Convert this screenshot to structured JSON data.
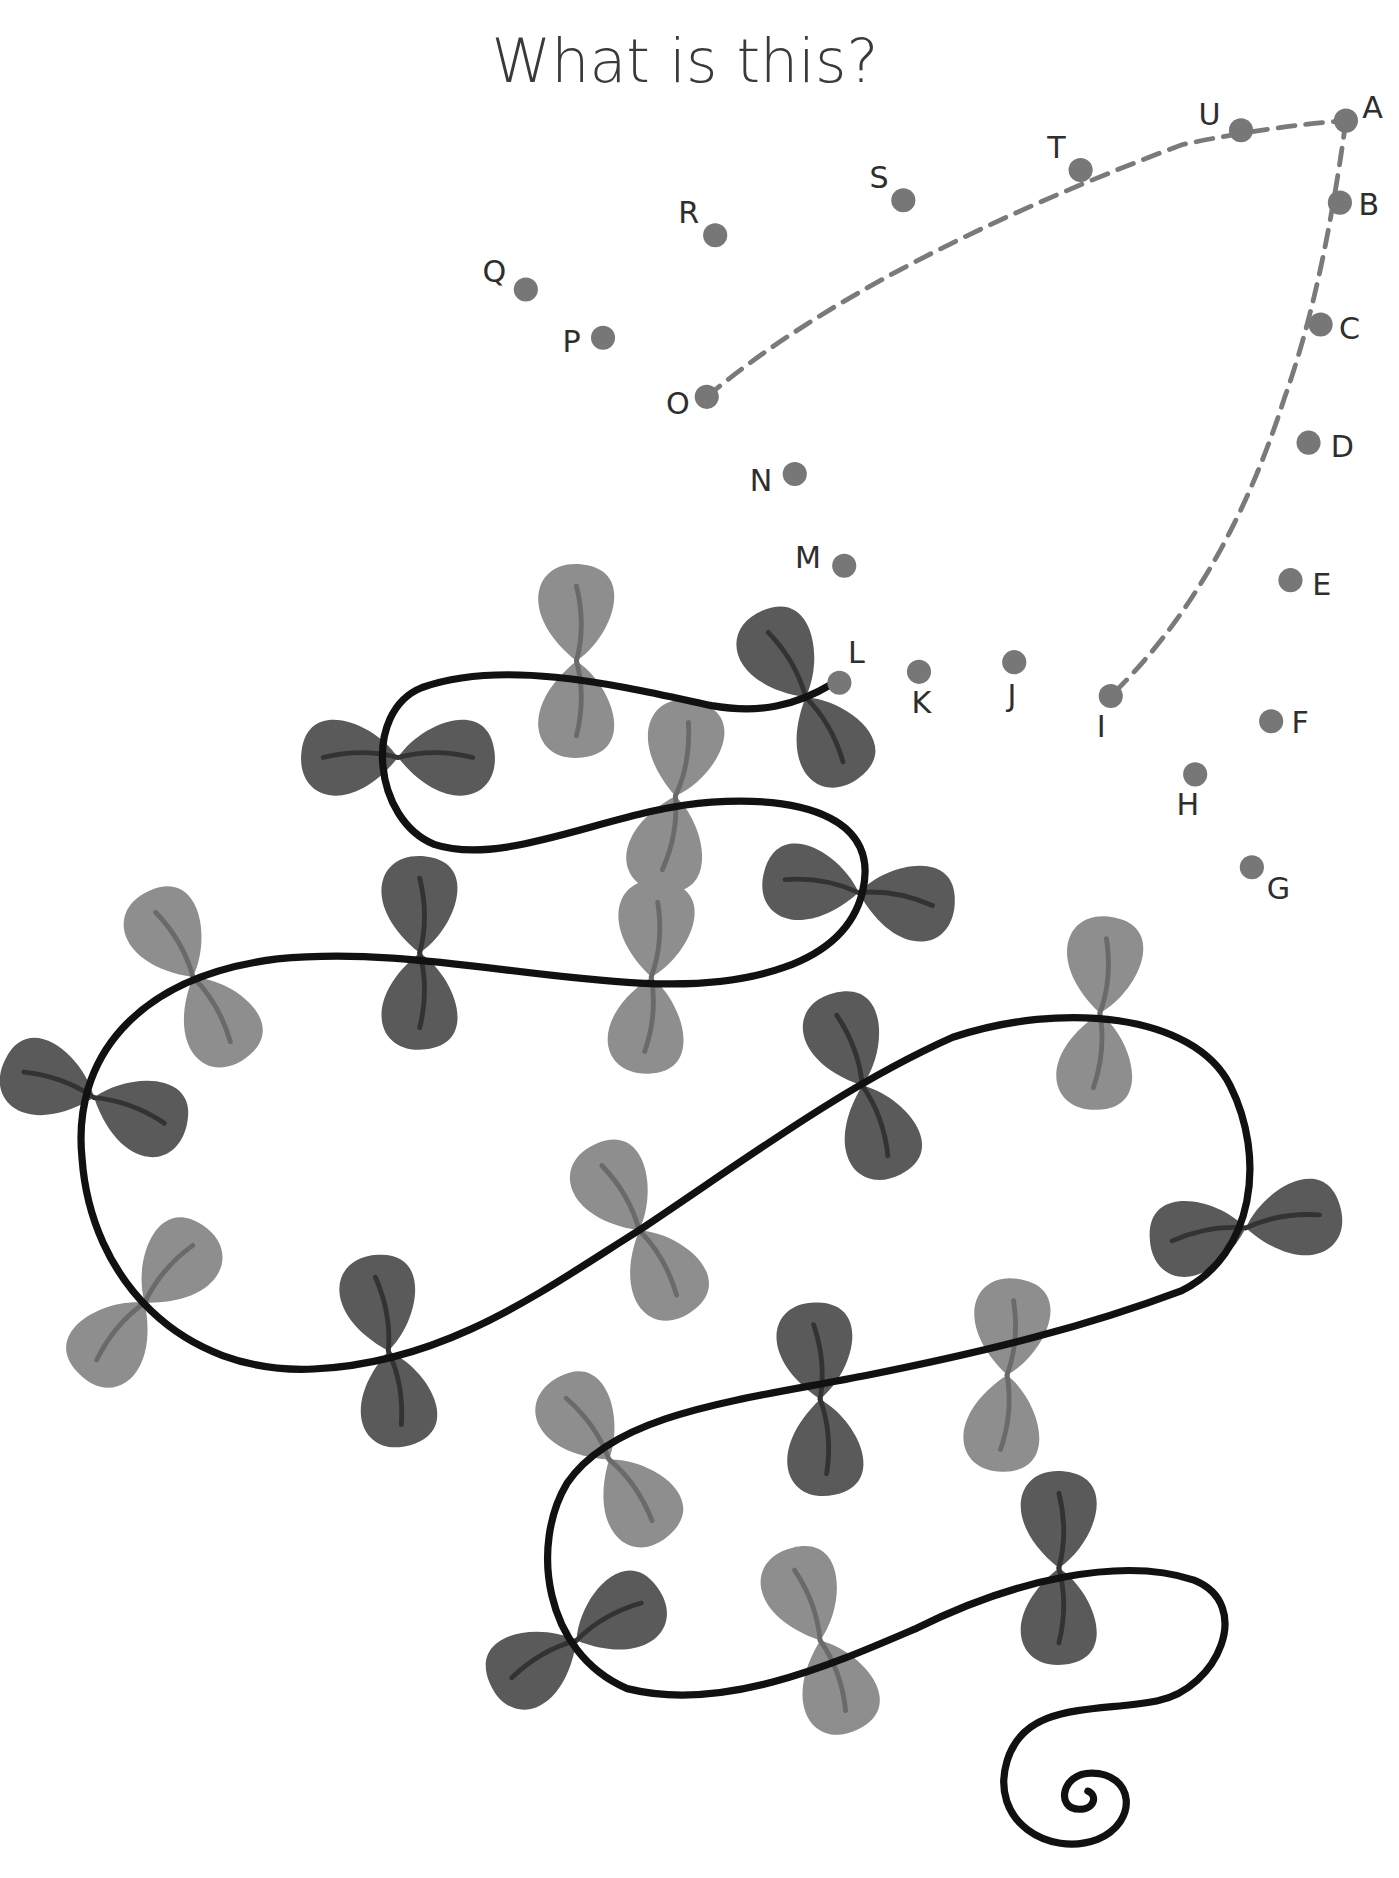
{
  "title": "What is this?",
  "colors": {
    "background": "#ffffff",
    "dot": "#777777",
    "dashed_line": "#7a7a7a",
    "vine": "#111111",
    "leaf_dark": "#5a5a5a",
    "leaf_light": "#8e8e8e",
    "leaf_vein_dark": "#333333",
    "leaf_vein_light": "#6a6a6a",
    "title": "#3a3a3a"
  },
  "dots": [
    {
      "label": "A",
      "x": 1116,
      "y": 100
    },
    {
      "label": "B",
      "x": 1111,
      "y": 168
    },
    {
      "label": "C",
      "x": 1095,
      "y": 269
    },
    {
      "label": "D",
      "x": 1085,
      "y": 367
    },
    {
      "label": "E",
      "x": 1070,
      "y": 481
    },
    {
      "label": "F",
      "x": 1054,
      "y": 598
    },
    {
      "label": "G",
      "x": 1038,
      "y": 719
    },
    {
      "label": "H",
      "x": 991,
      "y": 642
    },
    {
      "label": "I",
      "x": 921,
      "y": 577
    },
    {
      "label": "J",
      "x": 841,
      "y": 549
    },
    {
      "label": "K",
      "x": 762,
      "y": 557
    },
    {
      "label": "L",
      "x": 696,
      "y": 566
    },
    {
      "label": "M",
      "x": 700,
      "y": 469
    },
    {
      "label": "N",
      "x": 659,
      "y": 393
    },
    {
      "label": "O",
      "x": 586,
      "y": 329
    },
    {
      "label": "P",
      "x": 500,
      "y": 280
    },
    {
      "label": "Q",
      "x": 436,
      "y": 240
    },
    {
      "label": "R",
      "x": 593,
      "y": 195
    },
    {
      "label": "S",
      "x": 749,
      "y": 166
    },
    {
      "label": "T",
      "x": 896,
      "y": 141
    },
    {
      "label": "U",
      "x": 1029,
      "y": 108
    }
  ],
  "connected_segments": [
    {
      "from": "O",
      "to": "A",
      "style": "dashed"
    },
    {
      "from": "A",
      "to": "I",
      "style": "dashed"
    }
  ]
}
